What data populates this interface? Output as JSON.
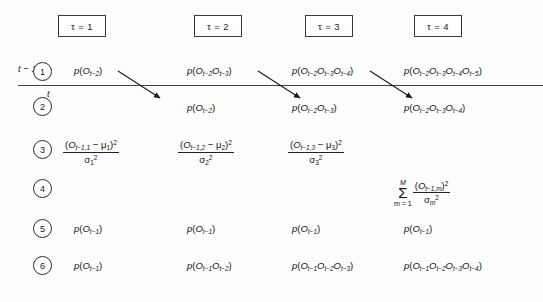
{
  "figure": {
    "columns": [
      {
        "header": "τ = 1",
        "x": 58,
        "width": 48
      },
      {
        "header": "τ = 2",
        "x": 194,
        "width": 48
      },
      {
        "header": "τ = 3",
        "x": 305,
        "width": 48
      },
      {
        "header": "τ = 4",
        "x": 414,
        "width": 48
      }
    ],
    "row_labels": [
      "1",
      "2",
      "3",
      "4",
      "5",
      "6"
    ],
    "time_labels": {
      "above": "t − 1",
      "below": "t"
    },
    "rows": [
      {
        "id": "row-1",
        "cells": [
          "p(Oₜ₋₂)",
          "p(Oₜ₋₂Oₜ₋₃)",
          "p(Oₜ₋₂Oₜ₋₃Oₜ₋₄)",
          "p(Oₜ₋₂Oₜ₋₃Oₜ₋₄Oₜ₋₅)"
        ]
      },
      {
        "id": "row-2",
        "cells": [
          "",
          "p(Oₜ₋₂)",
          "p(Oₜ₋₂Oₜ₋₃)",
          "p(Oₜ₋₂Oₜ₋₃Oₜ₋₄)"
        ]
      },
      {
        "id": "row-3",
        "cells": [
          "(Oₜ₋₁,₁ − μ₁)² / σ₁²",
          "(Oₜ₋₁,₂ − μ₂)² / σ₂²",
          "(Oₜ₋₁,₃ − μ₃)² / σ₃²",
          ""
        ]
      },
      {
        "id": "row-4",
        "cells": [
          "",
          "",
          "",
          "Σ m=1..M (Oₜ₋₁,ₘ)² / σₘ²"
        ]
      },
      {
        "id": "row-5",
        "cells": [
          "p(Oₜ₋₁)",
          "p(Oₜ₋₁)",
          "p(Oₜ₋₁)",
          "p(Oₜ₋₁)"
        ]
      },
      {
        "id": "row-6",
        "cells": [
          "p(Oₜ₋₁)",
          "p(Oₜ₋₁Oₜ₋₂)",
          "p(Oₜ₋₁Oₜ₋₂Oₜ₋₃)",
          "p(Oₜ₋₁Oₜ₋₂Oₜ₋₃Oₜ₋₄)"
        ]
      }
    ],
    "symbols": {
      "p": "p",
      "O": "O",
      "mu": "μ",
      "sigma": "σ",
      "sigma_sum": "Σ",
      "M": "M",
      "m_lower": "m = 1",
      "square": "2",
      "minus": "−"
    },
    "subscripts": {
      "t_minus_1": "t−1",
      "t_minus_2": "t−2",
      "t_minus_3": "t−3",
      "t_minus_4": "t−4",
      "t_minus_5": "t−5",
      "t_minus_1_1": "t−1,1",
      "t_minus_1_2": "t−1,2",
      "t_minus_1_3": "t−1,3",
      "t_minus_1_m": "t−1,m",
      "one": "1",
      "two": "2",
      "three": "3",
      "m": "m"
    },
    "arrows": [
      {
        "x1": 118,
        "y1": 71,
        "x2": 160,
        "y2": 98
      },
      {
        "x1": 258,
        "y1": 71,
        "x2": 300,
        "y2": 98
      },
      {
        "x1": 370,
        "y1": 71,
        "x2": 412,
        "y2": 98
      }
    ],
    "divider": {
      "x": 18,
      "y": 85,
      "width": 525
    },
    "colors": {
      "ink": "#1a1a1a",
      "line": "#444444",
      "box_border": "#3a3a3a",
      "background": "#fdfdfd"
    }
  }
}
